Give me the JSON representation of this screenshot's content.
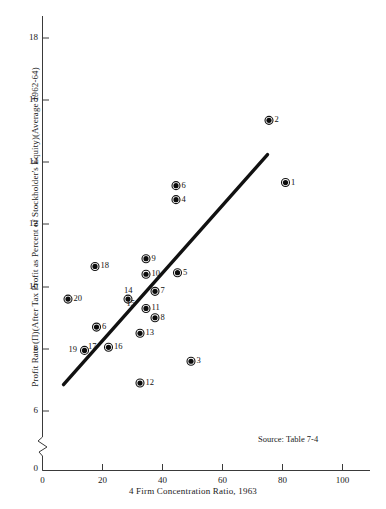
{
  "chart_data": {
    "type": "scatter",
    "title": "",
    "xlabel": "4 Firm Concentration Ratio, 1963",
    "ylabel": "Profit Rate (Π)(After Tax Profit as Percent of Stockholder's Equity)(Average 1962-64)",
    "xlim": [
      0,
      110
    ],
    "ylim": [
      5.2,
      19.2
    ],
    "xticks": [
      0,
      20,
      40,
      60,
      80,
      100
    ],
    "yticks": [
      0,
      6,
      8,
      10,
      12,
      14,
      16,
      18
    ],
    "y_axis_break": true,
    "y_axis_break_note": "axis broken between 0 and 6",
    "grid": false,
    "legend": "none",
    "source": "Source:  Table 7-4",
    "points": [
      {
        "label": "1",
        "x": 81.0,
        "y": 13.35,
        "label_pos": "right"
      },
      {
        "label": "2",
        "x": 75.5,
        "y": 15.35,
        "label_pos": "right"
      },
      {
        "label": "3",
        "x": 49.5,
        "y": 7.6,
        "label_pos": "right"
      },
      {
        "label": "4",
        "x": 44.5,
        "y": 12.8,
        "label_pos": "right"
      },
      {
        "label": "5",
        "x": 45.0,
        "y": 10.45,
        "label_pos": "right"
      },
      {
        "label": "6",
        "x": 44.5,
        "y": 13.25,
        "label_pos": "right"
      },
      {
        "label": "6",
        "x": 18.0,
        "y": 8.7,
        "label_pos": "right"
      },
      {
        "label": "7",
        "x": 37.5,
        "y": 9.85,
        "label_pos": "right"
      },
      {
        "label": "8",
        "x": 37.5,
        "y": 9.0,
        "label_pos": "right"
      },
      {
        "label": "9",
        "x": 34.5,
        "y": 10.9,
        "label_pos": "right"
      },
      {
        "label": "10",
        "x": 34.5,
        "y": 10.4,
        "label_pos": "right"
      },
      {
        "label": "11",
        "x": 34.5,
        "y": 9.3,
        "label_pos": "right"
      },
      {
        "label": "12",
        "x": 32.5,
        "y": 6.9,
        "label_pos": "right"
      },
      {
        "label": "13",
        "x": 32.5,
        "y": 8.5,
        "label_pos": "right"
      },
      {
        "label": "14",
        "x": 28.5,
        "y": 9.6,
        "label_pos": "above"
      },
      {
        "label": "15",
        "x": 30.0,
        "y": 9.2,
        "label_pos": "above-left",
        "hidden_marker": true
      },
      {
        "label": "16",
        "x": 22.0,
        "y": 8.05,
        "label_pos": "right"
      },
      {
        "label": "17",
        "x": 19.5,
        "y": 8.3,
        "label_pos": "below-left",
        "hidden_marker": true
      },
      {
        "label": "18",
        "x": 17.5,
        "y": 10.65,
        "label_pos": "right"
      },
      {
        "label": "19",
        "x": 14.0,
        "y": 7.95,
        "label_pos": "left"
      },
      {
        "label": "20",
        "x": 8.5,
        "y": 9.6,
        "label_pos": "right"
      }
    ],
    "trend_line": {
      "x1": 7.0,
      "y1": 6.85,
      "x2": 75.0,
      "y2": 14.25,
      "style": "solid-thick"
    }
  },
  "figure": {
    "source_note": "Source:  Table 7-4",
    "x_axis_title": "4 Firm Concentration Ratio, 1963",
    "y_axis_title": "Profit Rate (Π)(After Tax Profit as Percent of Stockholder's Equity)(Average 1962-64)",
    "y_tick_labels": [
      "18",
      "16",
      "14",
      "12",
      "10",
      "8",
      "6",
      "0"
    ],
    "x_tick_labels": [
      "0",
      "20",
      "40",
      "60",
      "80",
      "100"
    ],
    "x_origin_label": "0"
  }
}
